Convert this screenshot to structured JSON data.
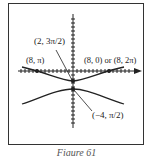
{
  "figure": {
    "caption": "Figure 61",
    "labels": {
      "top_point": "(2, 3π/2)",
      "left_point": "(8, π)",
      "right_point": "(8, 0) or (8, 2π)",
      "bottom_point": "(−4, π/2)"
    },
    "colors": {
      "ink": "#222222",
      "frame": "#333333",
      "background": "#ffffff"
    }
  }
}
